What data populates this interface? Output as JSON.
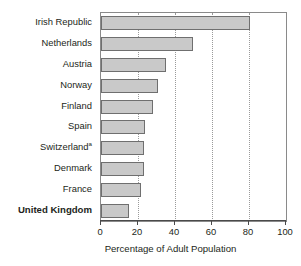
{
  "chart_data": {
    "type": "bar",
    "orientation": "horizontal",
    "title": "",
    "subtitle": "",
    "xlabel": "Percentage of Adult Population",
    "ylabel": "",
    "xlim": [
      0,
      100
    ],
    "xticks": [
      0,
      20,
      40,
      60,
      80,
      100
    ],
    "xtick_labels": [
      "0",
      "20",
      "40",
      "60",
      "80",
      "100"
    ],
    "grid": "vertical-dotted",
    "gridlines": [
      20,
      40,
      60,
      80
    ],
    "legend": null,
    "categories": [
      "Irish Republic",
      "Netherlands",
      "Austria",
      "Norway",
      "Finland",
      "Spain",
      "Switzerland",
      "Denmark",
      "France",
      "United Kingdom"
    ],
    "values": [
      80.5,
      49.5,
      35,
      31,
      28,
      24,
      23,
      23,
      21.5,
      15
    ],
    "bars": [
      {
        "label": "Irish Republic",
        "value": 80.5,
        "footnote": "",
        "highlight": false
      },
      {
        "label": "Netherlands",
        "value": 49.5,
        "footnote": "",
        "highlight": false
      },
      {
        "label": "Austria",
        "value": 35,
        "footnote": "",
        "highlight": false
      },
      {
        "label": "Norway",
        "value": 31,
        "footnote": "",
        "highlight": false
      },
      {
        "label": "Finland",
        "value": 28,
        "footnote": "",
        "highlight": false
      },
      {
        "label": "Spain",
        "value": 24,
        "footnote": "",
        "highlight": false
      },
      {
        "label": "Switzerland",
        "value": 23,
        "footnote": "a",
        "highlight": false
      },
      {
        "label": "Denmark",
        "value": 23,
        "footnote": "",
        "highlight": false
      },
      {
        "label": "France",
        "value": 21.5,
        "footnote": "",
        "highlight": false
      },
      {
        "label": "United Kingdom",
        "value": 15,
        "footnote": "",
        "highlight": true
      }
    ],
    "annotations": [
      "a"
    ],
    "colors": {
      "bar_fill": "#c9c9c9",
      "bar_stroke": "#6f6f6f",
      "frame": "#8a8a8a",
      "grid": "#9a9a9a",
      "text": "#231f20",
      "background": "#ffffff"
    }
  }
}
